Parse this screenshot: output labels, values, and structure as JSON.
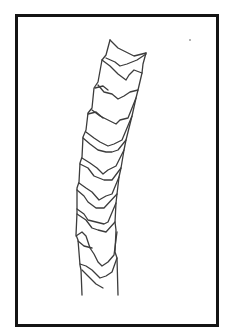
{
  "figure": {
    "frame_color": "#141414",
    "stroke_color": "#3a3a3a",
    "segment_count": 12
  }
}
